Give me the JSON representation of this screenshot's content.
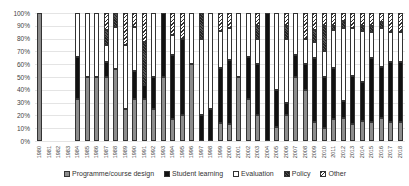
{
  "chart_data": {
    "type": "bar",
    "stacked": true,
    "percent": true,
    "title": "",
    "xlabel": "",
    "ylabel": "",
    "ylim": [
      0,
      100
    ],
    "yticks": [
      "0%",
      "10%",
      "20%",
      "30%",
      "40%",
      "50%",
      "60%",
      "70%",
      "80%",
      "90%",
      "100%"
    ],
    "grid": true,
    "legend_position": "bottom",
    "categories": [
      "1980",
      "1981",
      "1982",
      "1983",
      "1984",
      "1985",
      "1986",
      "1987",
      "1988",
      "1989",
      "1990",
      "1991",
      "1992",
      "1993",
      "1994",
      "1995",
      "1996",
      "1997",
      "1998",
      "1999",
      "2000",
      "2001",
      "2002",
      "2003",
      "2004",
      "2005",
      "2006",
      "2007",
      "2008",
      "2009",
      "2010",
      "2011",
      "2012",
      "2013",
      "2014",
      "2015",
      "2016",
      "2017",
      "2018"
    ],
    "series": [
      {
        "name": "Programme/course design",
        "color": "#8c8c8c",
        "values": [
          100,
          0,
          0,
          0,
          33,
          50,
          50,
          50,
          56,
          25,
          33,
          33,
          25,
          50,
          17,
          20,
          60,
          0,
          0,
          14,
          13,
          50,
          33,
          20,
          0,
          11,
          20,
          50,
          40,
          15,
          10,
          17,
          18,
          13,
          16,
          15,
          18,
          15,
          15
        ]
      },
      {
        "name": "Student learning",
        "color": "#111111",
        "values": [
          0,
          0,
          0,
          0,
          33,
          0,
          0,
          12,
          0,
          0,
          22,
          11,
          25,
          50,
          50,
          60,
          0,
          20,
          25,
          43,
          50,
          0,
          33,
          40,
          100,
          29,
          10,
          17,
          20,
          50,
          40,
          40,
          13,
          38,
          30,
          50,
          40,
          47,
          47
        ]
      },
      {
        "name": "Evaluation",
        "color": "#ffffff",
        "values": [
          0,
          0,
          0,
          0,
          34,
          50,
          50,
          13,
          33,
          50,
          34,
          0,
          50,
          0,
          16,
          0,
          40,
          60,
          75,
          29,
          25,
          50,
          34,
          20,
          0,
          60,
          50,
          33,
          20,
          12,
          20,
          30,
          57,
          37,
          40,
          20,
          30,
          23,
          23
        ]
      },
      {
        "name": "Policy",
        "color": "#333333",
        "values": [
          0,
          0,
          0,
          0,
          0,
          0,
          0,
          12,
          11,
          0,
          0,
          33,
          0,
          0,
          0,
          0,
          0,
          20,
          0,
          0,
          0,
          0,
          0,
          10,
          0,
          0,
          10,
          0,
          0,
          10,
          20,
          3,
          6,
          0,
          4,
          5,
          5,
          0,
          0
        ]
      },
      {
        "name": "Other",
        "color": "#cccccc",
        "values": [
          0,
          0,
          0,
          0,
          0,
          0,
          0,
          13,
          0,
          25,
          11,
          23,
          0,
          0,
          17,
          20,
          0,
          0,
          0,
          14,
          12,
          0,
          0,
          10,
          0,
          0,
          10,
          0,
          20,
          13,
          10,
          10,
          6,
          12,
          10,
          10,
          7,
          15,
          15
        ]
      }
    ]
  },
  "legend": {
    "items": [
      {
        "label": "Programme/course design"
      },
      {
        "label": "Student learning"
      },
      {
        "label": "Evaluation"
      },
      {
        "label": "Policy"
      },
      {
        "label": "Other"
      }
    ]
  }
}
